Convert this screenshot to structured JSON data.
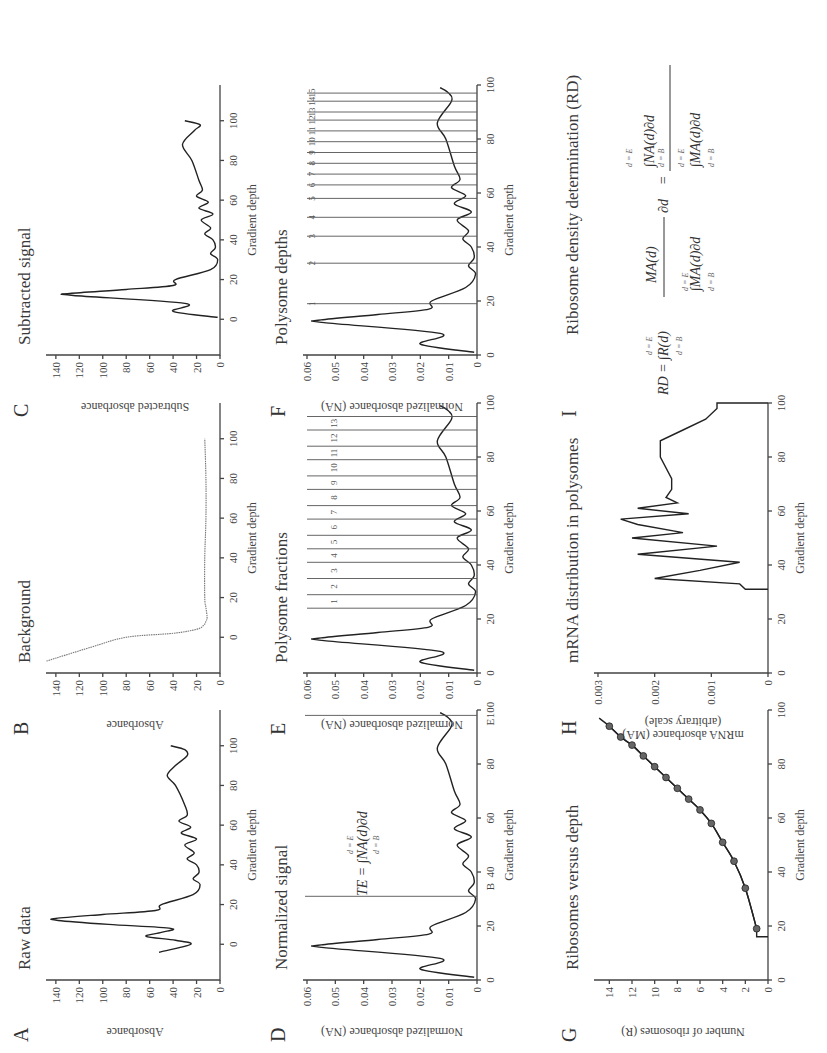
{
  "figure": {
    "orientation": "rotated 90° counter-clockwise",
    "panels": [
      {
        "letter": "A",
        "title": "Raw data",
        "xlabel": "Gradient depth",
        "ylabel": "Absorbance"
      },
      {
        "letter": "B",
        "title": "Background",
        "xlabel": "Gradient depth",
        "ylabel": "Absorbance"
      },
      {
        "letter": "C",
        "title": "Subtracted signal",
        "xlabel": "Gradient depth",
        "ylabel": "Subtracted absorbance"
      },
      {
        "letter": "D",
        "title": "Normalized signal",
        "xlabel": "Gradient depth",
        "ylabel": "Normalized absorbance (NA)"
      },
      {
        "letter": "E",
        "title": "Polysome fractions",
        "xlabel": "Gradient depth",
        "ylabel": "Normalized absorbance (NA)"
      },
      {
        "letter": "F",
        "title": "Polysome depths",
        "xlabel": "Gradient depth",
        "ylabel": "Normalized absorbance (NA)"
      },
      {
        "letter": "G",
        "title": "Ribosomes versus depth",
        "xlabel": "Gradient depth",
        "ylabel": "Number of ribosomes (R)"
      },
      {
        "letter": "H",
        "title": "mRNA distribution in polysomes",
        "xlabel": "Gradient depth",
        "ylabel": "mRNA absorbance (MA)",
        "ylabel2": "(arbitrary scale)"
      },
      {
        "letter": "I",
        "title": "Ribosome density determination (RD)"
      }
    ],
    "formulas": {
      "te": {
        "lhs": "TE =",
        "integrand": "∫NA(d)∂d",
        "upper": "d = E",
        "lower": "d = B"
      },
      "rd": {
        "lhs": "RD =",
        "part1": "∫R(d)",
        "upper": "d = E",
        "lower": "d = B",
        "frac_num": "MA(d)",
        "frac_den": "∫MA(d)∂d",
        "dd": "∂d",
        "eq": "=",
        "rhs_num": "∫NA(d)∂d",
        "rhs_den": "∫MA(d)∂d"
      }
    },
    "markers": {
      "B": "B",
      "E": "E"
    }
  },
  "chart_data": [
    {
      "panel": "A",
      "type": "line",
      "title": "Raw data",
      "xlabel": "Gradient depth",
      "ylabel": "Absorbance",
      "xlim": [
        -18,
        118
      ],
      "ylim": [
        0,
        145
      ],
      "xticks": [
        0,
        20,
        40,
        60,
        80,
        100
      ],
      "yticks": [
        0,
        20,
        40,
        60,
        80,
        100,
        120,
        140
      ],
      "x": [
        -4,
        0,
        2,
        4,
        6,
        8,
        10,
        12,
        13,
        15,
        17,
        20,
        25,
        30,
        33,
        36,
        40,
        43,
        46,
        50,
        53,
        56,
        59,
        62,
        65,
        70,
        80,
        85,
        90,
        95,
        98,
        100
      ],
      "y": [
        52,
        25,
        38,
        63,
        50,
        42,
        95,
        138,
        140,
        100,
        55,
        50,
        23,
        17,
        23,
        18,
        20,
        28,
        22,
        30,
        20,
        33,
        25,
        35,
        28,
        30,
        38,
        45,
        38,
        28,
        30,
        42
      ]
    },
    {
      "panel": "B",
      "type": "line",
      "title": "Background",
      "xlabel": "Gradient depth",
      "ylabel": "Absorbance",
      "xlim": [
        -18,
        118
      ],
      "ylim": [
        0,
        145
      ],
      "xticks": [
        0,
        20,
        40,
        60,
        80,
        100
      ],
      "yticks": [
        0,
        20,
        40,
        60,
        80,
        100,
        120,
        140
      ],
      "x": [
        -12,
        -5,
        0,
        2,
        4,
        6,
        8,
        10,
        15,
        20,
        40,
        60,
        80,
        100
      ],
      "y": [
        148,
        110,
        80,
        40,
        20,
        14,
        12,
        11,
        12,
        13,
        13,
        12,
        12,
        13
      ]
    },
    {
      "panel": "C",
      "type": "line",
      "title": "Subtracted signal",
      "xlabel": "Gradient depth",
      "ylabel": "Subtracted absorbance",
      "xlim": [
        -18,
        118
      ],
      "ylim": [
        0,
        145
      ],
      "xticks": [
        0,
        20,
        40,
        60,
        80,
        100
      ],
      "yticks": [
        0,
        20,
        40,
        60,
        80,
        100,
        120,
        140
      ],
      "x": [
        1,
        4,
        8,
        12,
        13,
        15,
        17,
        20,
        25,
        30,
        33,
        36,
        40,
        43,
        46,
        50,
        53,
        56,
        59,
        62,
        65,
        70,
        80,
        88,
        95,
        98,
        100
      ],
      "y": [
        2,
        40,
        30,
        125,
        128,
        80,
        40,
        38,
        8,
        2,
        8,
        4,
        6,
        13,
        8,
        16,
        6,
        18,
        10,
        20,
        15,
        18,
        24,
        32,
        22,
        17,
        30
      ]
    },
    {
      "panel": "D",
      "type": "line",
      "title": "Normalized signal",
      "xlabel": "Gradient depth",
      "ylabel": "Normalized absorbance (NA)",
      "xlim": [
        0,
        100
      ],
      "ylim": [
        0,
        0.06
      ],
      "xticks": [
        0,
        20,
        40,
        60,
        80,
        100
      ],
      "yticks": [
        0,
        0.01,
        0.02,
        0.03,
        0.04,
        0.05,
        0.06
      ],
      "x": [
        1,
        4,
        8,
        12,
        13,
        15,
        17,
        20,
        25,
        30,
        33,
        36,
        40,
        43,
        46,
        50,
        53,
        56,
        59,
        62,
        65,
        70,
        80,
        86,
        94,
        97,
        99
      ],
      "y": [
        0.001,
        0.02,
        0.013,
        0.054,
        0.055,
        0.035,
        0.017,
        0.016,
        0.004,
        0.0005,
        0.003,
        0.001,
        0.002,
        0.005,
        0.003,
        0.007,
        0.002,
        0.008,
        0.004,
        0.009,
        0.006,
        0.008,
        0.011,
        0.014,
        0.009,
        0.01,
        0.013
      ],
      "vertical_lines": [
        {
          "x": 31,
          "label": "B"
        },
        {
          "x": 98,
          "label": "E"
        }
      ],
      "annotation": "TE = ∫ NA(d)∂d from d=B to d=E"
    },
    {
      "panel": "E",
      "type": "line",
      "title": "Polysome fractions",
      "xlabel": "Gradient depth",
      "ylabel": "Normalized absorbance (NA)",
      "xlim": [
        0,
        100
      ],
      "ylim": [
        0,
        0.06
      ],
      "xticks": [
        0,
        20,
        40,
        60,
        80,
        100
      ],
      "yticks": [
        0,
        0.01,
        0.02,
        0.03,
        0.04,
        0.05,
        0.06
      ],
      "fraction_boundaries": [
        24,
        29,
        35,
        41,
        46,
        51,
        57,
        62,
        68,
        73,
        79,
        84,
        90,
        95
      ],
      "fraction_labels": [
        "1",
        "2",
        "3",
        "4",
        "5",
        "6",
        "7",
        "8",
        "9",
        "10",
        "11",
        "12",
        "13"
      ]
    },
    {
      "panel": "F",
      "type": "line",
      "title": "Polysome depths",
      "xlabel": "Gradient depth",
      "ylabel": "Normalized absorbance (NA)",
      "xlim": [
        0,
        100
      ],
      "ylim": [
        0,
        0.06
      ],
      "xticks": [
        0,
        20,
        40,
        60,
        80,
        100
      ],
      "yticks": [
        0,
        0.01,
        0.02,
        0.03,
        0.04,
        0.05,
        0.06
      ],
      "polysome_depths": [
        19,
        34,
        44,
        51,
        58,
        63,
        67,
        71,
        75,
        79,
        83,
        87,
        90,
        94,
        97
      ],
      "depth_labels": [
        "1",
        "2",
        "3",
        "4",
        "5",
        "6",
        "7",
        "8",
        "9",
        "10",
        "11",
        "12",
        "13",
        "14",
        "15"
      ]
    },
    {
      "panel": "G",
      "type": "line",
      "title": "Ribosomes versus depth",
      "xlabel": "Gradient depth",
      "ylabel": "Number of ribosomes (R)",
      "xlim": [
        0,
        100
      ],
      "ylim": [
        0,
        15
      ],
      "xticks": [
        0,
        20,
        40,
        60,
        80,
        100
      ],
      "yticks": [
        0,
        2,
        4,
        6,
        8,
        10,
        12,
        14
      ],
      "x": [
        19,
        34,
        44,
        51,
        58,
        63,
        67,
        71,
        75,
        79,
        83,
        87,
        90,
        94
      ],
      "y": [
        1,
        2,
        3,
        4,
        5,
        6,
        7,
        8,
        9,
        10,
        11,
        12,
        13,
        14
      ],
      "marker": "circle"
    },
    {
      "panel": "H",
      "type": "line",
      "title": "mRNA distribution in polysomes",
      "xlabel": "Gradient depth",
      "ylabel": "mRNA absorbance (MA) (arbitrary scale)",
      "xlim": [
        0,
        100
      ],
      "ylim": [
        0,
        0.003
      ],
      "xticks": [
        0,
        20,
        40,
        60,
        80,
        100
      ],
      "yticks": [
        0,
        0.001,
        0.002,
        0.003
      ],
      "x": [
        31,
        31,
        33,
        35,
        38,
        41,
        44,
        47,
        50,
        52,
        55,
        57,
        59,
        61,
        63,
        65,
        68,
        72,
        80,
        86,
        90,
        94,
        98,
        100,
        100
      ],
      "y": [
        0,
        0.0004,
        0.0005,
        0.002,
        0.0012,
        0.0005,
        0.0023,
        0.0009,
        0.0024,
        0.0015,
        0.0023,
        0.0026,
        0.0014,
        0.0023,
        0.0016,
        0.0018,
        0.0017,
        0.0017,
        0.0019,
        0.0019,
        0.0015,
        0.0011,
        0.0009,
        0.0009,
        0
      ]
    },
    {
      "panel": "I",
      "type": "table",
      "title": "Ribosome density determination (RD)",
      "content": "RD = ∫_{d=B}^{d=E} R(d) · MA(d) / ∫_{d=B}^{d=E} MA(d)∂d ∂d = ∫ NA(d)∂d / ∫ MA(d)∂d"
    }
  ]
}
